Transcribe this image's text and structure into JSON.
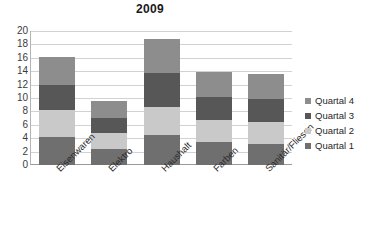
{
  "chart_data": {
    "type": "bar",
    "stacked": true,
    "title": "2009",
    "xlabel": "",
    "ylabel": "",
    "ylim": [
      0,
      20
    ],
    "yticks": [
      0,
      2,
      4,
      6,
      8,
      10,
      12,
      14,
      16,
      18,
      20
    ],
    "grid": true,
    "legend_position": "right",
    "categories": [
      "Eisenwaren",
      "Elektro",
      "Haushalt",
      "Farben",
      "Sanitär/Fliesen"
    ],
    "series": [
      {
        "name": "Quartal 1",
        "color": "#6f6f6f",
        "values": [
          4.2,
          2.4,
          4.5,
          3.5,
          3.2
        ]
      },
      {
        "name": "Quartal 2",
        "color": "#c9c9c9",
        "values": [
          4.0,
          2.4,
          4.2,
          3.2,
          3.2
        ]
      },
      {
        "name": "Quartal 3",
        "color": "#575757",
        "values": [
          3.7,
          2.2,
          5.1,
          3.4,
          3.4
        ]
      },
      {
        "name": "Quartal 4",
        "color": "#8d8d8d",
        "values": [
          4.2,
          2.5,
          5.0,
          3.8,
          3.8
        ]
      }
    ],
    "series_totals": [
      16.1,
      9.5,
      18.8,
      13.9,
      13.6
    ],
    "legend_order": [
      "Quartal 4",
      "Quartal 3",
      "Quartal 2",
      "Quartal 1"
    ]
  }
}
